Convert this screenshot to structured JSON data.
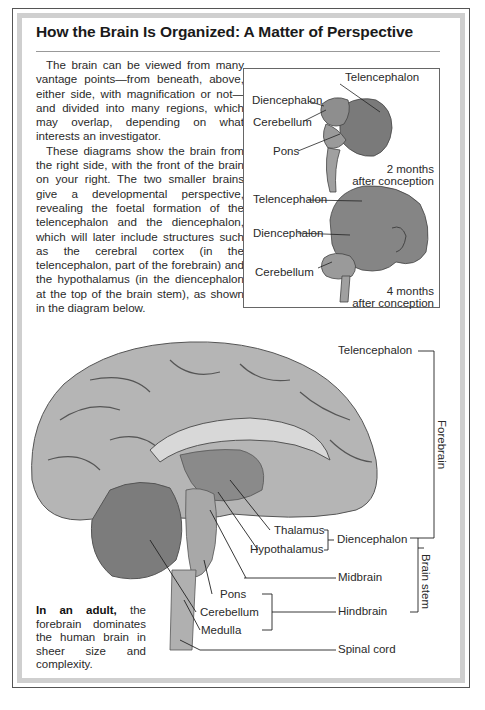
{
  "title": "How the Brain Is Organized: A Matter of Perspective",
  "intro": {
    "paragraphs": [
      "The brain can be viewed from many vantage points—from beneath, above, either side, with magnification or not—and divided into many regions, which may overlap, depending on what interests an investigator.",
      "These diagrams show the brain from the right side, with the front of the brain on your right. The two smaller brains give a developmental perspective, revealing the foetal formation of the telencephalon and the diencephalon, which will later include structures such as the cerebral cortex (in the telencephalon, part of the forebrain) and the hypothalamus (in the diencephalon at the top of the brain stem), as shown in the diagram below."
    ]
  },
  "inset": {
    "two_months": {
      "labels": {
        "telencephalon": "Telencephalon",
        "diencephalon": "Diencephalon",
        "cerebellum": "Cerebellum",
        "pons": "Pons"
      },
      "caption_line1": "2 months",
      "caption_line2": "after conception"
    },
    "four_months": {
      "labels": {
        "telencephalon": "Telencephalon",
        "diencephalon": "Diencephalon",
        "cerebellum": "Cerebellum"
      },
      "caption_line1": "4 months",
      "caption_line2": "after conception"
    }
  },
  "adult_diagram": {
    "labels": {
      "telencephalon": "Telencephalon",
      "thalamus": "Thalamus",
      "hypothalamus": "Hypothalamus",
      "diencephalon": "Diencephalon",
      "midbrain": "Midbrain",
      "pons": "Pons",
      "cerebellum": "Cerebellum",
      "medulla": "Medulla",
      "hindbrain": "Hindbrain",
      "spinal_cord": "Spinal cord"
    },
    "groups": {
      "forebrain": "Forebrain",
      "brain_stem": "Brain stem"
    },
    "note_bold": "In an adult,",
    "note_rest": " the forebrain dominates the human brain in sheer size and complexity."
  },
  "colors": {
    "brain_fill": "#8c8c8c",
    "brain_dark": "#5a5a5a",
    "brain_light": "#c8c8c8",
    "frame_gray": "#cfcfcf",
    "line": "#333333"
  }
}
